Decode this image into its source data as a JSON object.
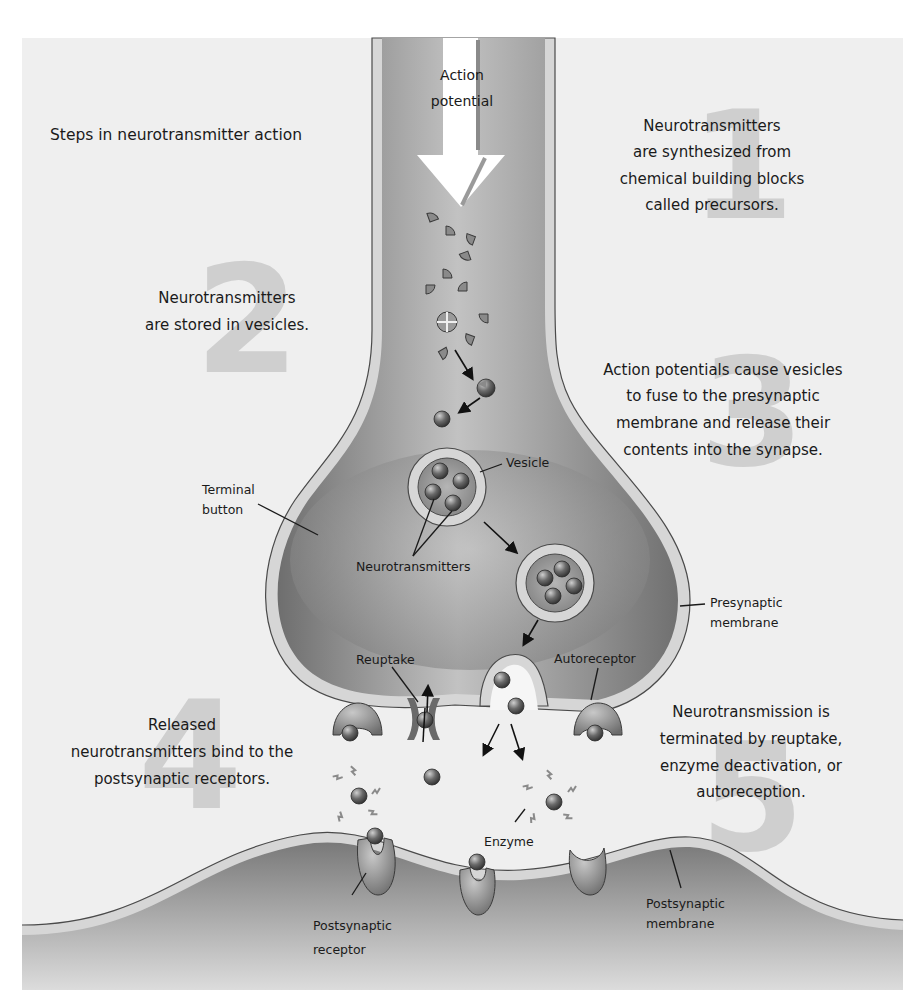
{
  "title": "Steps in neurotransmitter action",
  "steps": [
    {
      "number": "1",
      "lines": [
        "Neurotransmitters",
        "are synthesized from",
        "chemical building blocks",
        "called precursors."
      ]
    },
    {
      "number": "2",
      "lines": [
        "Neurotransmitters",
        "are stored in vesicles."
      ]
    },
    {
      "number": "3",
      "lines": [
        "Action potentials cause vesicles",
        "to fuse to the presynaptic",
        "membrane and release their",
        "contents into the synapse."
      ]
    },
    {
      "number": "4",
      "lines": [
        "Released",
        "neurotransmitters bind to the",
        "postsynaptic receptors."
      ]
    },
    {
      "number": "5",
      "lines": [
        "Neurotransmission is",
        "terminated by reuptake,",
        "enzyme deactivation, or",
        "autoreception."
      ]
    }
  ],
  "labels": {
    "action_potential": [
      "Action",
      "potential"
    ],
    "vesicle": "Vesicle",
    "terminal_button": [
      "Terminal",
      "button"
    ],
    "neurotransmitters": "Neurotransmitters",
    "presynaptic_membrane": [
      "Presynaptic",
      "membrane"
    ],
    "reuptake": "Reuptake",
    "autoreceptor": "Autoreceptor",
    "enzyme": "Enzyme",
    "postsynaptic_receptor": [
      "Postsynaptic",
      "receptor"
    ],
    "postsynaptic_membrane": [
      "Postsynaptic",
      "membrane"
    ]
  },
  "colors": {
    "panel_bg": "#efefef",
    "neuron_dark": "#7a7a7a",
    "neuron_light": "#b9b9b9",
    "membrane": "#d6d6d6",
    "numeral": "#cfcfcf",
    "text": "#1a1a1a"
  }
}
